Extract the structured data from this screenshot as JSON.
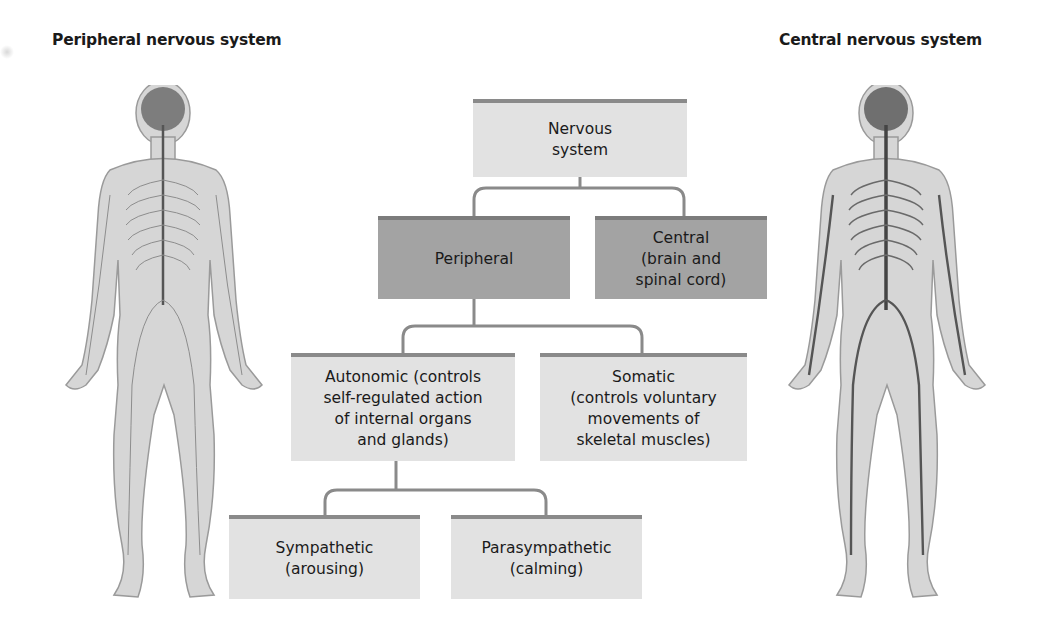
{
  "titles": {
    "left": "Peripheral nervous system",
    "right": "Central nervous system"
  },
  "nodes": {
    "root": "Nervous\nsystem",
    "peripheral": "Peripheral",
    "central": "Central\n(brain and\nspinal cord)",
    "autonomic": "Autonomic (controls\nself-regulated action\nof internal organs\nand glands)",
    "somatic": "Somatic\n(controls voluntary\nmovements of\nskeletal muscles)",
    "sympathetic": "Sympathetic\n(arousing)",
    "parasympathetic": "Parasympathetic\n(calming)"
  },
  "figures": {
    "left": "human-figure-peripheral-nerves",
    "right": "human-figure-central-nerves"
  },
  "colors": {
    "light_box": "#e2e2e2",
    "dark_box": "#a3a3a3",
    "connector": "#8a8a8a",
    "figure_fill": "#d6d6d6",
    "nerve": "#555555"
  }
}
